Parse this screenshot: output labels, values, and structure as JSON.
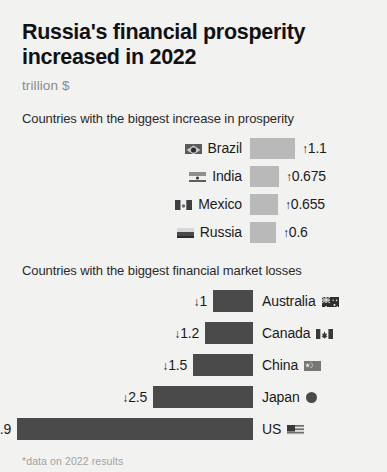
{
  "header": {
    "title": "Russia's financial prosperity increased in 2022",
    "subtitle": "trillion $"
  },
  "sections": {
    "gains_caption": "Countries with the biggest increase in prosperity",
    "losses_caption": "Countries with the biggest financial market losses"
  },
  "footer": {
    "footnote": "*data on 2022 results",
    "source": "Source: UBS Switzerland AG report"
  },
  "colors": {
    "background": "#f2f2f1",
    "gain_bar": "#b9b9b9",
    "loss_bar": "#4a4a4a",
    "title_text": "#111111",
    "subtitle_text": "#8b8b8b",
    "footnote_text": "#a3a3a3",
    "source_text": "#6d6d6d"
  },
  "icons": {
    "up_arrow": "↑",
    "down_arrow": "↓"
  },
  "chart_data": {
    "type": "bar",
    "title": "Russia's financial prosperity increased in 2022",
    "subtitle": "trillion $",
    "unit": "trillion $",
    "xlabel": "",
    "ylabel": "",
    "grid": false,
    "legend": "none",
    "orientation": "horizontal",
    "series": [
      {
        "name": "Countries with the biggest increase in prosperity",
        "direction": "increase",
        "color": "#b9b9b9",
        "categories": [
          "Brazil",
          "India",
          "Mexico",
          "Russia"
        ],
        "values": [
          1.1,
          0.675,
          0.655,
          0.6
        ],
        "value_labels": [
          "↑1.1",
          "↑0.675",
          "↑0.655",
          "↑0.6"
        ]
      },
      {
        "name": "Countries with the biggest financial market losses",
        "direction": "loss",
        "color": "#4a4a4a",
        "categories": [
          "Australia",
          "Canada",
          "China",
          "Japan",
          "US"
        ],
        "values": [
          -1,
          -1.2,
          -1.5,
          -2.5,
          -5.9
        ],
        "value_labels": [
          "↓1",
          "↓1.2",
          "↓1.5",
          "↓2.5",
          "↓5.9"
        ]
      }
    ]
  },
  "gains": [
    {
      "country": "Brazil",
      "flag": "brazil-flag-icon",
      "value": "1.1",
      "bar_width": 45
    },
    {
      "country": "India",
      "flag": "india-flag-icon",
      "value": "0.675",
      "bar_width": 29
    },
    {
      "country": "Mexico",
      "flag": "mexico-flag-icon",
      "value": "0.655",
      "bar_width": 28
    },
    {
      "country": "Russia",
      "flag": "russia-flag-icon",
      "value": "0.6",
      "bar_width": 26
    }
  ],
  "losses": [
    {
      "country": "Australia",
      "flag": "australia-flag-icon",
      "value": "1",
      "bar_width": 40
    },
    {
      "country": "Canada",
      "flag": "canada-flag-icon",
      "value": "1.2",
      "bar_width": 48
    },
    {
      "country": "China",
      "flag": "china-flag-icon",
      "value": "1.5",
      "bar_width": 60
    },
    {
      "country": "Japan",
      "flag": "japan-flag-icon",
      "value": "2.5",
      "bar_width": 100
    },
    {
      "country": "US",
      "flag": "us-flag-icon",
      "value": "5.9",
      "bar_width": 236
    }
  ]
}
